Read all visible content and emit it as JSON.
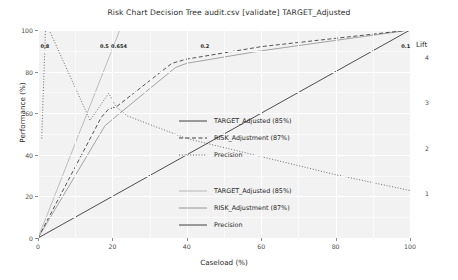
{
  "chart_data": {
    "type": "line",
    "title": "Risk Chart Decision Tree audit.csv [validate] TARGET_Adjusted",
    "xlabel": "Caseload (%)",
    "ylabel": "Performance (%)",
    "y2label": "Lift",
    "xlim": [
      0,
      100
    ],
    "ylim": [
      0,
      100
    ],
    "y2lim": [
      0,
      4.6
    ],
    "grid": true,
    "legend_position": "center-right",
    "xticks": [
      0,
      20,
      40,
      60,
      80,
      100
    ],
    "yticks": [
      0,
      20,
      40,
      60,
      80,
      100
    ],
    "y2ticks": [
      1,
      2,
      3,
      4
    ],
    "annotations": {
      "risk_scores_title": "Risk Scores",
      "risk_scores": [
        {
          "label": "0.8",
          "x": 2
        },
        {
          "label": "0.5",
          "x": 18
        },
        {
          "label": "0.654",
          "x": 21
        },
        {
          "label": "0.2",
          "x": 45
        },
        {
          "label": "0.1",
          "x": 99
        }
      ],
      "precision_end": "23%"
    },
    "series": [
      {
        "name": "TARGET_Adjusted (85%)",
        "key": "target-adjusted",
        "style": "solid",
        "color": "#9a9a9a",
        "axis": "left",
        "x": [
          0,
          18,
          20,
          22,
          37,
          40,
          60,
          80,
          100
        ],
        "y": [
          0,
          54,
          57,
          60,
          82,
          84,
          90,
          95,
          100
        ]
      },
      {
        "name": "RISK_Adjustment (87%)",
        "key": "risk-adjustment",
        "style": "dashed",
        "color": "#2b2b2b",
        "axis": "left",
        "x": [
          0,
          17,
          19,
          21,
          36,
          40,
          60,
          80,
          100
        ],
        "y": [
          0,
          58,
          62,
          63,
          84,
          86,
          92,
          96,
          100
        ]
      },
      {
        "name": "Precision",
        "key": "precision",
        "style": "dotted",
        "color": "#4a4a4a",
        "axis": "right",
        "x": [
          1,
          2,
          3,
          14,
          19,
          21,
          24,
          40,
          60,
          80,
          100
        ],
        "y2": [
          2.2,
          4.6,
          4.6,
          2.6,
          3.2,
          2.9,
          2.7,
          2.2,
          1.8,
          1.4,
          1.05
        ]
      },
      {
        "name": "Lift reference",
        "key": "lift-reference",
        "style": "solid",
        "color": "#3a3a3a",
        "axis": "left",
        "x": [
          0,
          100
        ],
        "y": [
          0,
          100
        ]
      },
      {
        "name": "Risk score guide",
        "key": "risk-score-guide",
        "style": "solid",
        "color": "#b5b5b5",
        "axis": "left",
        "x": [
          0,
          22
        ],
        "y": [
          0,
          100
        ]
      }
    ],
    "legends": [
      {
        "id": "performance-legend",
        "entries": [
          {
            "label": "TARGET_Adjusted (85%)",
            "style": "solid",
            "color": "#2b2b2b"
          },
          {
            "label": "RISK_Adjustment (87%)",
            "style": "dashed",
            "color": "#2b2b2b"
          },
          {
            "label": "Precision",
            "style": "dotted",
            "color": "#4a4a4a"
          }
        ]
      },
      {
        "id": "lift-legend",
        "entries": [
          {
            "label": "TARGET_Adjusted (85%)",
            "style": "solid",
            "color": "#b0b0b0"
          },
          {
            "label": "RISK_Adjustment (87%)",
            "style": "solid",
            "color": "#8a8a8a"
          },
          {
            "label": "Precision",
            "style": "solid",
            "color": "#2b2b2b"
          }
        ]
      }
    ]
  }
}
